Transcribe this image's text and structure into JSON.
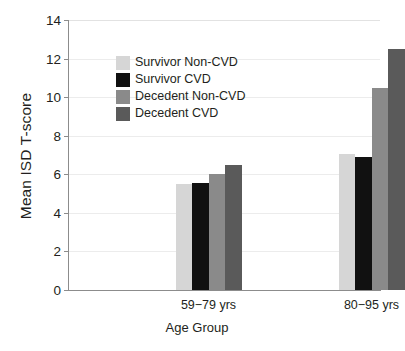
{
  "chart_data": {
    "type": "bar",
    "title": "",
    "xlabel": "Age Group",
    "ylabel": "Mean ISD T-score",
    "categories": [
      "59−79 yrs",
      "80−95 yrs"
    ],
    "ylim": [
      0,
      14
    ],
    "yticks": [
      0,
      2,
      4,
      6,
      8,
      10,
      12,
      14
    ],
    "ytick_labels": [
      "0",
      "2",
      "4",
      "6",
      "8",
      "10",
      "12",
      "14"
    ],
    "grid": true,
    "legend_position": "upper left inside",
    "series": [
      {
        "name": "Survivor Non-CVD",
        "color": "#d6d6d6",
        "values": [
          5.5,
          7.05
        ]
      },
      {
        "name": "Survivor CVD",
        "color": "#111111",
        "values": [
          5.55,
          6.9
        ]
      },
      {
        "name": "Decedent Non-CVD",
        "color": "#8a8a8a",
        "values": [
          6.0,
          10.45
        ]
      },
      {
        "name": "Decedent CVD",
        "color": "#5a5a5a",
        "values": [
          6.5,
          12.5
        ]
      }
    ]
  },
  "axes": {
    "axis_color": "#8c8c8c",
    "grid_color": "#ececec",
    "text_color": "#231f20"
  }
}
